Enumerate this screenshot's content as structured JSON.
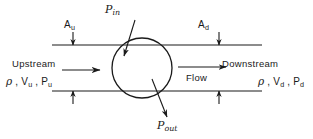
{
  "diagram": {
    "stroke_color": "#1a1a1a",
    "background_color": "#ffffff",
    "labels": {
      "area_upstream": "A",
      "area_upstream_sub": "u",
      "area_downstream": "A",
      "area_downstream_sub": "d",
      "power_in": "P",
      "power_in_sub": "in",
      "power_out": "P",
      "power_out_sub": "out",
      "upstream": "Upstream",
      "downstream": "Downstream",
      "flow": "Flow",
      "upstream_props_density": "ρ",
      "upstream_props_sep1": " , ",
      "upstream_props_velocity": "V",
      "upstream_props_velocity_sub": "u",
      "upstream_props_sep2": " , ",
      "upstream_props_pressure": "P",
      "upstream_props_pressure_sub": "u",
      "downstream_props_density": "ρ",
      "downstream_props_sep1": " , ",
      "downstream_props_velocity": "V",
      "downstream_props_velocity_sub": "d",
      "downstream_props_sep2": " , ",
      "downstream_props_pressure": "P",
      "downstream_props_pressure_sub": "d"
    },
    "geometry": {
      "pipe_top_y": 45,
      "pipe_bottom_y": 91,
      "pipe_left_x": 52,
      "pipe_right_x": 262,
      "circle_cx": 142,
      "circle_cy": 68,
      "circle_r": 30,
      "tick_left_x": 73,
      "tick_right_x": 219,
      "flow_arrow_left": {
        "x1": 62,
        "y1": 70,
        "x2": 100,
        "y2": 70
      },
      "flow_arrow_right": {
        "x1": 178,
        "y1": 67,
        "x2": 226,
        "y2": 67
      },
      "power_in_arrow": {
        "x1": 134,
        "y1": 21,
        "x2": 124,
        "y2": 55
      },
      "power_out_arrow": {
        "x1": 153,
        "y1": 80,
        "x2": 166,
        "y2": 116
      }
    }
  }
}
